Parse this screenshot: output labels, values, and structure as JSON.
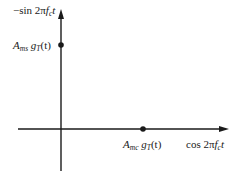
{
  "diagram": {
    "type": "signal-space-constellation",
    "axes": {
      "vertical": {
        "label_prefix": "−sin 2π",
        "label_f": "f",
        "label_sub": "c",
        "label_t": "t"
      },
      "horizontal": {
        "label_prefix": "cos 2π",
        "label_f": "f",
        "label_sub": "c",
        "label_t": "t"
      }
    },
    "points": [
      {
        "axis": "vertical",
        "A": "A",
        "A_sub": "ms",
        "g": "g",
        "g_sub": "T",
        "arg": "(t)"
      },
      {
        "axis": "horizontal",
        "A": "A",
        "A_sub": "mc",
        "g": "g",
        "g_sub": "T",
        "arg": "(t)"
      }
    ],
    "colors": {
      "line": "#1a1a1a",
      "background": "#ffffff"
    }
  }
}
